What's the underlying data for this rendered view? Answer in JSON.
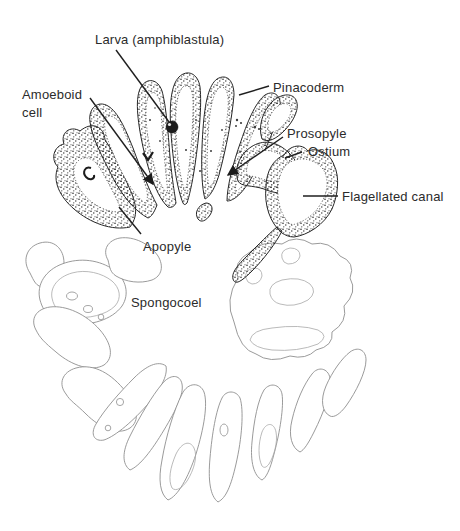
{
  "figure": {
    "type": "labeled-anatomical-line-drawing",
    "background": "#ffffff"
  },
  "colors": {
    "ink": "#1f1f1f",
    "label_text": "#2b2b2b",
    "light_outline": "#8f8f8f",
    "stipple": "#2e2e2e"
  },
  "labels": {
    "larva": {
      "text": "Larva (amphiblastula)"
    },
    "amoeboid": {
      "line1": "Amoeboid",
      "line2": "cell"
    },
    "pinacoderm": {
      "text": "Pinacoderm"
    },
    "prosopyle": {
      "text": "Prosopyle"
    },
    "ostium": {
      "text": "Ostium"
    },
    "flagellated_canal": {
      "text": "Flagellated canal"
    },
    "apopyle": {
      "text": "Apopyle"
    },
    "spongocoel": {
      "text": "Spongocoel"
    }
  }
}
